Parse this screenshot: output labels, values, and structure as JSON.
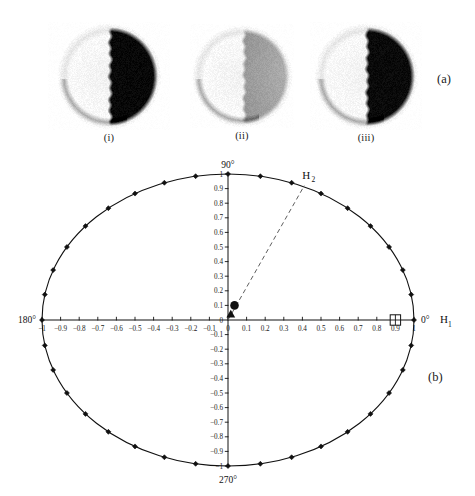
{
  "figure": {
    "panel_a_letter": "(a)",
    "panel_b_letter": "(b)"
  },
  "panel_a": {
    "caption_letter": "(a)",
    "images": [
      {
        "id": "i",
        "label": "(i)",
        "modality": "scintigram",
        "fill_side": "right",
        "intensity": "high",
        "peak_gray": 8,
        "halo": true
      },
      {
        "id": "ii",
        "label": "(ii)",
        "modality": "scintigram",
        "fill_side": "right",
        "intensity": "low",
        "peak_gray": 150,
        "halo": true
      },
      {
        "id": "iii",
        "label": "(iii)",
        "modality": "scintigram",
        "fill_side": "right",
        "intensity": "high",
        "peak_gray": 10,
        "halo": true
      }
    ]
  },
  "chart_data": {
    "type": "scatter",
    "title": "",
    "subtitle": "",
    "xlabel": "",
    "ylabel": "",
    "xlim": [
      -1,
      1
    ],
    "ylim": [
      -1,
      1
    ],
    "grid": false,
    "legend_position": "none",
    "projection": "polar-unit-circle",
    "direction_labels": [
      {
        "text": "90°",
        "angle_deg": 90,
        "position": "top"
      },
      {
        "text": "180°",
        "angle_deg": 180,
        "position": "left"
      },
      {
        "text": "270°",
        "angle_deg": 270,
        "position": "bottom"
      },
      {
        "text": "0°",
        "angle_deg": 0,
        "position": "right"
      }
    ],
    "axis_annotations": [
      {
        "text": "H",
        "subscript": "1",
        "at_angle_deg": 0,
        "position": "right-outside"
      },
      {
        "text": "H",
        "subscript": "2",
        "at_angle_deg": 66,
        "position": "upper-right-outside"
      }
    ],
    "x_ticks": [
      -1,
      -0.9,
      -0.8,
      -0.7,
      -0.6,
      -0.5,
      -0.4,
      -0.3,
      -0.2,
      -0.1,
      0,
      0.1,
      0.2,
      0.3,
      0.4,
      0.5,
      0.6,
      0.7,
      0.8,
      0.9,
      1
    ],
    "x_tick_labels": [
      "-1",
      "-0.9",
      "-0.8",
      "-0.7",
      "-0.6",
      "-0.5",
      "-0.4",
      "-0.3",
      "-0.2",
      "-0.1",
      "0",
      "0.1",
      "0.2",
      "0.3",
      "0.4",
      "0.5",
      "0.6",
      "0.7",
      "0.8",
      "0.9",
      "1"
    ],
    "y_ticks": [
      -1,
      -0.9,
      -0.8,
      -0.7,
      -0.6,
      -0.5,
      -0.4,
      -0.3,
      -0.2,
      -0.1,
      0,
      0.1,
      0.2,
      0.3,
      0.4,
      0.5,
      0.6,
      0.7,
      0.8,
      0.9,
      1
    ],
    "y_tick_labels": [
      "-1",
      "-0.9",
      "-0.8",
      "-0.7",
      "-0.6",
      "-0.5",
      "-0.4",
      "-0.3",
      "-0.2",
      "-0.1",
      "0",
      "0.1",
      "0.2",
      "0.3",
      "0.4",
      "0.5",
      "0.6",
      "0.7",
      "0.8",
      "0.9",
      "1"
    ],
    "series": [
      {
        "name": "unit-circle-samples",
        "marker": "filled-diamond",
        "line": "solid",
        "angles_deg": [
          0,
          10,
          20,
          30,
          40,
          50,
          60,
          70,
          80,
          90,
          100,
          110,
          120,
          130,
          140,
          150,
          160,
          170,
          180,
          190,
          200,
          210,
          220,
          230,
          240,
          250,
          260,
          270,
          280,
          290,
          300,
          310,
          320,
          330,
          340,
          350
        ],
        "x": [
          1,
          0.985,
          0.94,
          0.866,
          0.766,
          0.643,
          0.5,
          0.342,
          0.174,
          0,
          -0.174,
          -0.342,
          -0.5,
          -0.643,
          -0.766,
          -0.866,
          -0.94,
          -0.985,
          -1,
          -0.985,
          -0.94,
          -0.866,
          -0.766,
          -0.643,
          -0.5,
          -0.342,
          -0.174,
          0,
          0.174,
          0.342,
          0.5,
          0.643,
          0.766,
          0.866,
          0.94,
          0.985
        ],
        "y": [
          0,
          0.174,
          0.342,
          0.5,
          0.643,
          0.766,
          0.866,
          0.94,
          0.985,
          1,
          0.985,
          0.94,
          0.866,
          0.766,
          0.643,
          0.5,
          0.342,
          0.174,
          0,
          -0.174,
          -0.342,
          -0.5,
          -0.643,
          -0.766,
          -0.866,
          -0.94,
          -0.985,
          -1,
          -0.985,
          -0.94,
          -0.866,
          -0.766,
          -0.643,
          -0.5,
          -0.342,
          -0.174
        ]
      }
    ],
    "special_markers": [
      {
        "name": "crossed-square",
        "marker": "crossed-square",
        "x": 0.9,
        "y": 0.0,
        "label": ""
      },
      {
        "name": "filled-circle",
        "marker": "filled-circle",
        "x": 0.035,
        "y": 0.1,
        "label": ""
      },
      {
        "name": "filled-triangle",
        "marker": "filled-triangle",
        "x": 0.015,
        "y": 0.04,
        "label": ""
      }
    ],
    "annotation_lines": [
      {
        "name": "h2-axis",
        "style": "dashed",
        "from": [
          0.0,
          0.0
        ],
        "to": [
          0.41,
          0.92
        ],
        "angle_deg": 66
      }
    ]
  }
}
